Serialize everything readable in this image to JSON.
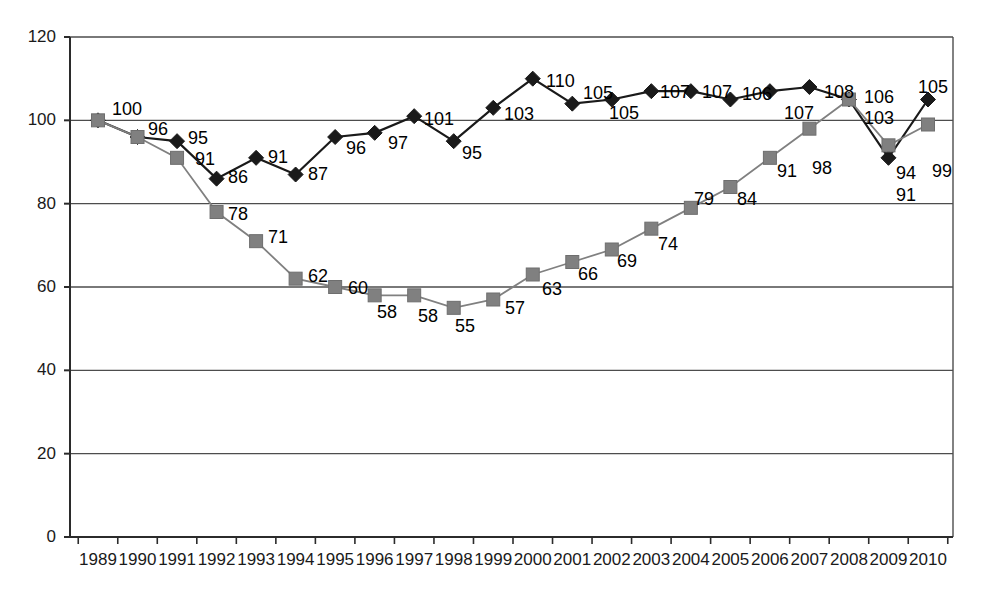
{
  "chart_data": {
    "type": "line",
    "title": "",
    "subtitle": "",
    "xlabel": "",
    "ylabel": "",
    "xlim": [
      1989,
      2010
    ],
    "ylim": [
      0,
      120
    ],
    "yticks": [
      0,
      20,
      40,
      60,
      80,
      100,
      120
    ],
    "grid": "horizontal",
    "legend": "none",
    "categories": [
      "1989",
      "1990",
      "1991",
      "1992",
      "1993",
      "1994",
      "1995",
      "1996",
      "1997",
      "1998",
      "1999",
      "2000",
      "2001",
      "2002",
      "2003",
      "2004",
      "2005",
      "2006",
      "2007",
      "2008",
      "2009",
      "2010"
    ],
    "series": [
      {
        "name": "black-diamond-series",
        "marker": "diamond",
        "color": "#1a1a1a",
        "values": [
          100,
          96,
          95,
          86,
          91,
          87,
          96,
          97,
          101,
          95,
          103,
          110,
          104,
          105,
          107,
          107,
          105,
          107,
          108,
          105,
          91,
          105
        ],
        "labels": [
          "100",
          "96",
          "95",
          "86",
          "91",
          "87",
          "96",
          "97",
          "101",
          "95",
          "103",
          "110",
          "105",
          "105",
          "107",
          "107",
          "106",
          "107",
          "108",
          "106",
          "91",
          "105"
        ]
      },
      {
        "name": "gray-square-series",
        "marker": "square",
        "color": "#808080",
        "values": [
          100,
          96,
          91,
          78,
          71,
          62,
          60,
          58,
          58,
          55,
          57,
          63,
          66,
          69,
          74,
          79,
          84,
          91,
          98,
          105,
          94,
          99
        ],
        "labels": [
          "100",
          "96",
          "91",
          "78",
          "71",
          "62",
          "60",
          "58",
          "58",
          "55",
          "57",
          "63",
          "66",
          "69",
          "74",
          "79",
          "84",
          "91",
          "98",
          "103",
          "94",
          "99"
        ]
      }
    ]
  },
  "axis": {
    "y_tick_labels": [
      "120",
      "100",
      "80",
      "60",
      "40",
      "20",
      "0"
    ],
    "x_tick_labels": [
      "1989",
      "1990",
      "1991",
      "1992",
      "1993",
      "1994",
      "1995",
      "1996",
      "1997",
      "1998",
      "1999",
      "2000",
      "2001",
      "2002",
      "2003",
      "2004",
      "2005",
      "2006",
      "2007",
      "2008",
      "2009",
      "2010"
    ]
  },
  "point_labels": [
    {
      "text": "100",
      "x": 112,
      "y": 100
    },
    {
      "text": "96",
      "x": 148,
      "y": 120
    },
    {
      "text": "95",
      "x": 188,
      "y": 129
    },
    {
      "text": "91",
      "x": 195,
      "y": 150
    },
    {
      "text": "86",
      "x": 228,
      "y": 168
    },
    {
      "text": "78",
      "x": 228,
      "y": 205
    },
    {
      "text": "91",
      "x": 268,
      "y": 148
    },
    {
      "text": "71",
      "x": 268,
      "y": 228
    },
    {
      "text": "87",
      "x": 308,
      "y": 165
    },
    {
      "text": "62",
      "x": 308,
      "y": 267
    },
    {
      "text": "96",
      "x": 346,
      "y": 139
    },
    {
      "text": "60",
      "x": 348,
      "y": 279
    },
    {
      "text": "97",
      "x": 388,
      "y": 134
    },
    {
      "text": "58",
      "x": 377,
      "y": 303
    },
    {
      "text": "101",
      "x": 424,
      "y": 110
    },
    {
      "text": "58",
      "x": 418,
      "y": 307
    },
    {
      "text": "95",
      "x": 462,
      "y": 144
    },
    {
      "text": "55",
      "x": 455,
      "y": 317
    },
    {
      "text": "103",
      "x": 504,
      "y": 105
    },
    {
      "text": "57",
      "x": 505,
      "y": 299
    },
    {
      "text": "110",
      "x": 546,
      "y": 72
    },
    {
      "text": "63",
      "x": 542,
      "y": 280
    },
    {
      "text": "105",
      "x": 583,
      "y": 84
    },
    {
      "text": "66",
      "x": 578,
      "y": 265
    },
    {
      "text": "105",
      "x": 609,
      "y": 104
    },
    {
      "text": "69",
      "x": 617,
      "y": 252
    },
    {
      "text": "107",
      "x": 660,
      "y": 83
    },
    {
      "text": "74",
      "x": 658,
      "y": 235
    },
    {
      "text": "107",
      "x": 702,
      "y": 83
    },
    {
      "text": "79",
      "x": 694,
      "y": 190
    },
    {
      "text": "106",
      "x": 742,
      "y": 85
    },
    {
      "text": "84",
      "x": 737,
      "y": 190
    },
    {
      "text": "107",
      "x": 784,
      "y": 104
    },
    {
      "text": "91",
      "x": 777,
      "y": 162
    },
    {
      "text": "108",
      "x": 824,
      "y": 83
    },
    {
      "text": "98",
      "x": 812,
      "y": 159
    },
    {
      "text": "106",
      "x": 864,
      "y": 88
    },
    {
      "text": "103",
      "x": 864,
      "y": 109
    },
    {
      "text": "94",
      "x": 896,
      "y": 164
    },
    {
      "text": "91",
      "x": 896,
      "y": 186
    },
    {
      "text": "105",
      "x": 918,
      "y": 78
    },
    {
      "text": "99",
      "x": 932,
      "y": 162
    }
  ]
}
